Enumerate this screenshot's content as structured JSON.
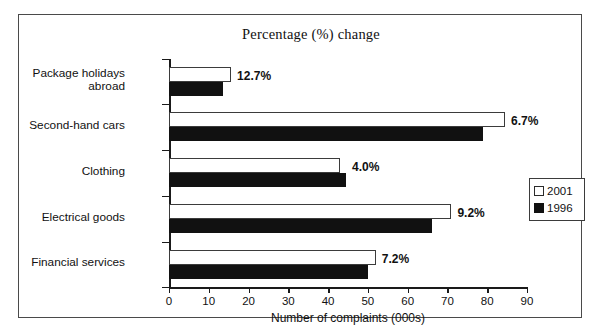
{
  "chart_data": {
    "type": "bar",
    "orientation": "horizontal",
    "title": "Percentage (%) change",
    "xlabel": "Number of complaints (000s)",
    "ylabel": "",
    "xlim": [
      0,
      90
    ],
    "xticks": [
      0,
      10,
      20,
      30,
      40,
      50,
      60,
      70,
      80,
      90
    ],
    "grid": false,
    "legend_position": "right",
    "categories": [
      "Package holidays\nabroad",
      "Second-hand cars",
      "Clothing",
      "Electrical goods",
      "Financial services"
    ],
    "series": [
      {
        "name": "2001",
        "color": "#ffffff",
        "values": [
          15.6,
          84.5,
          43.0,
          71.0,
          52.0
        ]
      },
      {
        "name": "1996",
        "color": "#111111",
        "values": [
          13.5,
          79.0,
          44.5,
          66.0,
          50.0
        ]
      }
    ],
    "annotations": [
      "12.7%",
      "6.7%",
      "4.0%",
      "9.2%",
      "7.2%"
    ],
    "annotation_label": "Percentage (%) change"
  },
  "legend": {
    "entries": [
      {
        "label": "2001",
        "swatch": "white-square-icon"
      },
      {
        "label": "1996",
        "swatch": "black-square-icon"
      }
    ]
  },
  "colors": {
    "series_2001": "#ffffff",
    "series_1996": "#111111",
    "axis": "#1a1a1a",
    "frame": "#4a4a4a",
    "text": "#111111",
    "background": "#ffffff"
  }
}
